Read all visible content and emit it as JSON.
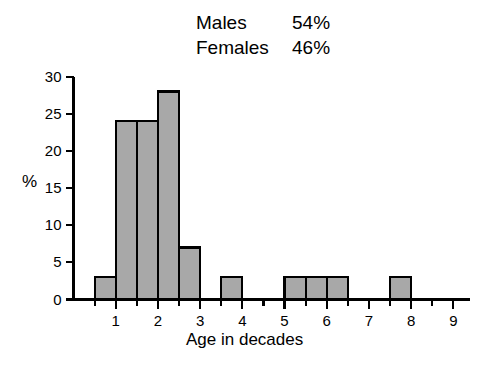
{
  "legend": {
    "rows": [
      {
        "label": "Males",
        "value": "54%"
      },
      {
        "label": "Females",
        "value": "46%"
      }
    ]
  },
  "axes": {
    "ylabel": "%",
    "xlabel": "Age in decades",
    "yticks": [
      "0",
      "5",
      "10",
      "15",
      "20",
      "25",
      "30"
    ],
    "xticks": [
      "1",
      "2",
      "3",
      "4",
      "5",
      "6",
      "7",
      "8",
      "9"
    ]
  },
  "colors": {
    "bar_fill": "#a8a8a8",
    "bar_edge": "#000000",
    "axis": "#000000",
    "background": "#ffffff"
  },
  "chart_data": {
    "type": "bar",
    "title": "",
    "subtitle": "",
    "xlabel": "Age in decades",
    "ylabel": "%",
    "xlim": [
      0,
      9.4
    ],
    "ylim": [
      0,
      30
    ],
    "ytick_step": 5,
    "xtick_step": 1,
    "minor_xtick_step": 0.5,
    "grid": false,
    "legend_position": "top-center",
    "bin_width": 0.5,
    "bin_edges": [
      0.5,
      1.0,
      1.5,
      2.0,
      2.5,
      3.0,
      3.5,
      4.0,
      4.5,
      5.0,
      5.5,
      6.0,
      6.5,
      7.0,
      7.5,
      8.0
    ],
    "bin_starts": [
      0.5,
      1.0,
      1.5,
      2.0,
      2.5,
      3.0,
      3.5,
      4.0,
      4.5,
      5.0,
      5.5,
      6.0,
      6.5,
      7.0,
      7.5
    ],
    "categories": [
      "0.5-1.0",
      "1.0-1.5",
      "1.5-2.0",
      "2.0-2.5",
      "2.5-3.0",
      "3.0-3.5",
      "3.5-4.0",
      "4.0-4.5",
      "4.5-5.0",
      "5.0-5.5",
      "5.5-6.0",
      "6.0-6.5",
      "6.5-7.0",
      "7.0-7.5",
      "7.5-8.0"
    ],
    "values": [
      3,
      24,
      24,
      28,
      7,
      0,
      3,
      0,
      0,
      3,
      3,
      3,
      0,
      0,
      3
    ],
    "annotations": [
      {
        "text": "Males 54%"
      },
      {
        "text": "Females 46%"
      }
    ]
  }
}
